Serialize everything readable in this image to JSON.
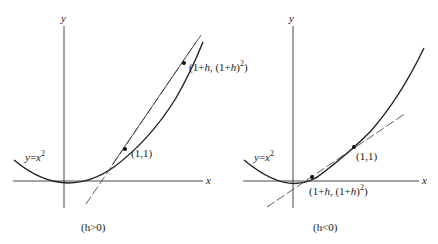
{
  "figure": {
    "panels": [
      {
        "id": "left",
        "condition": "(h>0)",
        "axis_x_label": "x",
        "axis_y_label": "y",
        "curve_label_lhs": "y",
        "curve_label_eq": "=",
        "curve_label_base": "x",
        "curve_label_exp": "2",
        "point_a_label": "(1,1)",
        "point_b_label_part1": "(1+",
        "point_b_label_h": "h",
        "point_b_label_part2": ",  (1+",
        "point_b_label_h2": "h",
        "point_b_label_part3": ")",
        "point_b_label_exp": "2",
        "point_b_label_close": ")"
      },
      {
        "id": "right",
        "condition": "(h<0)",
        "axis_x_label": "x",
        "axis_y_label": "y",
        "curve_label_lhs": "y",
        "curve_label_eq": "=",
        "curve_label_base": "x",
        "curve_label_exp": "2",
        "point_a_label": "(1,1)",
        "point_b_label_part1": "(1+",
        "point_b_label_h": "h",
        "point_b_label_part2": ",  (1+",
        "point_b_label_h2": "h",
        "point_b_label_part3": ")",
        "point_b_label_exp": "2",
        "point_b_label_close": ")"
      }
    ],
    "colors": {
      "ink": "#222222",
      "background": "#ffffff"
    }
  }
}
